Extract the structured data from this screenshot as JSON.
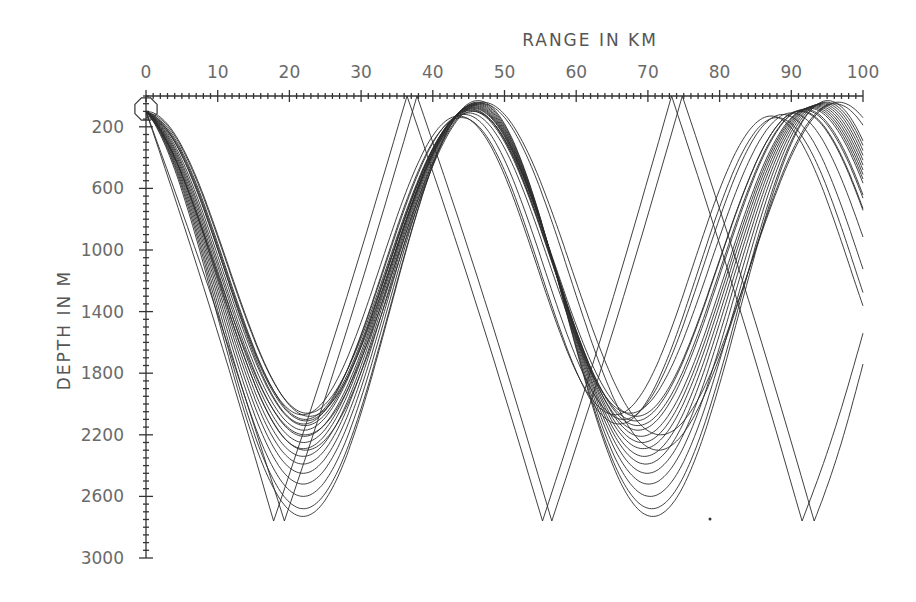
{
  "chart_data": {
    "type": "line",
    "title": "RANGE IN KM",
    "xlabel": "RANGE IN KM",
    "ylabel": "DEPTH IN M",
    "x_axis_position": "top",
    "y_axis_inverted": true,
    "xlim": [
      0,
      100
    ],
    "ylim": [
      0,
      3000
    ],
    "x_ticks": [
      0,
      10,
      20,
      30,
      40,
      50,
      60,
      70,
      80,
      90,
      100
    ],
    "y_ticks": [
      200,
      600,
      1000,
      1400,
      1800,
      2200,
      2600,
      3000
    ],
    "x_minor_step": 1,
    "y_minor_step": 50,
    "grid": false,
    "legend": null,
    "source": {
      "range_km": 0,
      "depth_m": 100,
      "marker": "octagon"
    },
    "annotation_dot": {
      "range_km": 79.5,
      "depth_m": 2750
    },
    "series": [
      {
        "name": "refracted-1",
        "kind": "refracted",
        "upper_m": 110,
        "lower_m": 2060,
        "half_cycle_km": 22.5,
        "start_depth_m": 100
      },
      {
        "name": "refracted-2",
        "kind": "refracted",
        "upper_m": 100,
        "lower_m": 2080,
        "half_cycle_km": 22.8,
        "start_depth_m": 100
      },
      {
        "name": "refracted-3",
        "kind": "refracted",
        "upper_m": 95,
        "lower_m": 2110,
        "half_cycle_km": 23.0,
        "start_depth_m": 100
      },
      {
        "name": "refracted-4",
        "kind": "refracted",
        "upper_m": 90,
        "lower_m": 2140,
        "half_cycle_km": 23.2,
        "start_depth_m": 100
      },
      {
        "name": "refracted-5",
        "kind": "refracted",
        "upper_m": 85,
        "lower_m": 2170,
        "half_cycle_km": 23.3,
        "start_depth_m": 100
      },
      {
        "name": "refracted-6",
        "kind": "refracted",
        "upper_m": 80,
        "lower_m": 2210,
        "half_cycle_km": 23.5,
        "start_depth_m": 100
      },
      {
        "name": "refracted-7",
        "kind": "refracted",
        "upper_m": 75,
        "lower_m": 2250,
        "half_cycle_km": 23.6,
        "start_depth_m": 100
      },
      {
        "name": "refracted-8",
        "kind": "refracted",
        "upper_m": 70,
        "lower_m": 2290,
        "half_cycle_km": 23.7,
        "start_depth_m": 100
      },
      {
        "name": "refracted-9",
        "kind": "refracted",
        "upper_m": 65,
        "lower_m": 2340,
        "half_cycle_km": 23.8,
        "start_depth_m": 100
      },
      {
        "name": "refracted-10",
        "kind": "refracted",
        "upper_m": 60,
        "lower_m": 2390,
        "half_cycle_km": 23.9,
        "start_depth_m": 100
      },
      {
        "name": "refracted-11",
        "kind": "refracted",
        "upper_m": 55,
        "lower_m": 2450,
        "half_cycle_km": 24.0,
        "start_depth_m": 100
      },
      {
        "name": "refracted-12",
        "kind": "refracted",
        "upper_m": 50,
        "lower_m": 2520,
        "half_cycle_km": 24.1,
        "start_depth_m": 100
      },
      {
        "name": "refracted-13",
        "kind": "refracted",
        "upper_m": 45,
        "lower_m": 2600,
        "half_cycle_km": 24.2,
        "start_depth_m": 100
      },
      {
        "name": "refracted-14",
        "kind": "refracted",
        "upper_m": 40,
        "lower_m": 2680,
        "half_cycle_km": 24.3,
        "start_depth_m": 100
      },
      {
        "name": "refracted-15",
        "kind": "refracted",
        "upper_m": 30,
        "lower_m": 2730,
        "half_cycle_km": 24.4,
        "start_depth_m": 100
      },
      {
        "name": "refracted-16",
        "kind": "refracted",
        "upper_m": 120,
        "lower_m": 2100,
        "half_cycle_km": 22.2,
        "start_depth_m": 100
      },
      {
        "name": "refracted-17",
        "kind": "refracted",
        "upper_m": 130,
        "lower_m": 2070,
        "half_cycle_km": 21.8,
        "start_depth_m": 100
      },
      {
        "name": "refracted-18",
        "kind": "refracted",
        "upper_m": 140,
        "lower_m": 2130,
        "half_cycle_km": 22.0,
        "start_depth_m": 100
      },
      {
        "name": "refracted-19",
        "kind": "refracted",
        "upper_m": 50,
        "lower_m": 2300,
        "half_cycle_km": 24.6,
        "start_depth_m": 100
      },
      {
        "name": "refracted-20",
        "kind": "refracted",
        "upper_m": 40,
        "lower_m": 2200,
        "half_cycle_km": 24.8,
        "start_depth_m": 100
      },
      {
        "name": "reflected-1",
        "kind": "reflected",
        "turning_points": [
          [
            0,
            100
          ],
          [
            17.8,
            2760
          ],
          [
            36.4,
            0
          ],
          [
            55.3,
            2760
          ],
          [
            73.3,
            0
          ],
          [
            91.5,
            2760
          ],
          [
            100,
            1540
          ]
        ]
      },
      {
        "name": "reflected-2",
        "kind": "reflected",
        "turning_points": [
          [
            0,
            100
          ],
          [
            19.3,
            2760
          ],
          [
            37.8,
            0
          ],
          [
            56.6,
            2760
          ],
          [
            74.8,
            0
          ],
          [
            93.2,
            2760
          ],
          [
            100,
            1740
          ]
        ]
      }
    ]
  }
}
